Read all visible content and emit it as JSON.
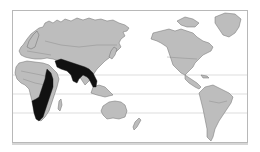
{
  "map": {
    "projection": "pacific-centered world",
    "frame": {
      "x": 12,
      "y": 10,
      "width": 236,
      "height": 133
    },
    "colors": {
      "background": "#ffffff",
      "land": "#bdbdbd",
      "land_outline": "#6e6e6e",
      "highlight_range": "#111111",
      "latitude_lines": "#cfcfcf",
      "frame_border": "#b8b8b8"
    },
    "latitude_lines_y": [
      74,
      93,
      112
    ],
    "regions": [
      {
        "name": "Eurasia",
        "style": "land"
      },
      {
        "name": "Africa",
        "style": "land"
      },
      {
        "name": "Australia",
        "style": "land"
      },
      {
        "name": "North America",
        "style": "land"
      },
      {
        "name": "Greenland",
        "style": "land"
      },
      {
        "name": "South America",
        "style": "land"
      },
      {
        "name": "New Zealand",
        "style": "land"
      }
    ],
    "highlighted_areas": [
      {
        "name": "Eastern and Southern Africa",
        "style": "highlight_range"
      },
      {
        "name": "Arabian Peninsula to South and Southeast Asia",
        "style": "highlight_range"
      }
    ]
  }
}
